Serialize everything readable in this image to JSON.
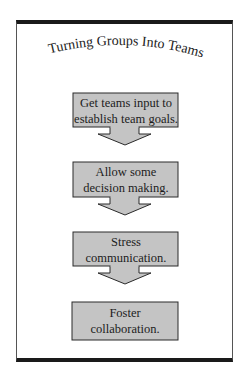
{
  "title": "Turning Groups Into Teams",
  "steps": [
    {
      "line1": "Get teams input to",
      "line2": "establish team goals."
    },
    {
      "line1": "Allow some",
      "line2": "decision making."
    },
    {
      "line1": "Stress",
      "line2": "communication."
    },
    {
      "line1": "Foster",
      "line2": "collaboration."
    }
  ],
  "colors": {
    "box_fill": "#c4c4c4",
    "box_stroke": "#2a2a2a",
    "border": "#1a1a1a",
    "text": "#1c1c1c"
  }
}
